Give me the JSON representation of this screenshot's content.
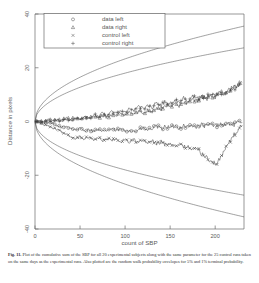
{
  "figure": {
    "number": "Fig. 11.",
    "caption": "Plot of the cumulative sum of the SBP for all 20 experimental subjects along with the same parameter for the 25 control runs taken on the same days as the experimental runs. Also plotted are the random walk probability envelopes for 5% and 1% terminal probability."
  },
  "chart_data": {
    "type": "line",
    "title": "",
    "xlabel": "count of SBP",
    "ylabel": "Distance in pixels",
    "xlim": [
      0,
      232
    ],
    "ylim": [
      -40,
      40
    ],
    "xticks": [
      0,
      50,
      100,
      150,
      200
    ],
    "yticks": [
      40,
      20,
      0,
      -20,
      -40
    ],
    "grid": false,
    "legend_position": "top-left",
    "legend": [
      {
        "marker": "circle",
        "label": "data left"
      },
      {
        "marker": "triangle",
        "label": "data right"
      },
      {
        "marker": "cross-x",
        "label": "control left"
      },
      {
        "marker": "plus",
        "label": "control right"
      }
    ],
    "envelopes": [
      {
        "name": "1% terminal probability upper",
        "k": 2.33,
        "sign": 1
      },
      {
        "name": "5% terminal probability upper",
        "k": 1.8,
        "sign": 1
      },
      {
        "name": "5% terminal probability lower",
        "k": 1.8,
        "sign": -1
      },
      {
        "name": "1% terminal probability lower",
        "k": 2.33,
        "sign": -1
      }
    ],
    "series": [
      {
        "name": "data left",
        "marker": "circle",
        "x": [
          0,
          5,
          10,
          15,
          20,
          25,
          30,
          35,
          40,
          45,
          50,
          55,
          60,
          65,
          70,
          75,
          80,
          85,
          90,
          95,
          100,
          105,
          110,
          115,
          120,
          125,
          130,
          135,
          140,
          145,
          150,
          155,
          160,
          165,
          170,
          175,
          180,
          185,
          190,
          195,
          200,
          205,
          210,
          215,
          220,
          225,
          230
        ],
        "y": [
          0,
          -0.3,
          -0.6,
          -0.4,
          -1.0,
          -1.6,
          -2.2,
          -1.8,
          -2.5,
          -3.1,
          -2.6,
          -3.4,
          -2.9,
          -3.6,
          -3.0,
          -3.8,
          -3.2,
          -2.7,
          -3.4,
          -2.9,
          -3.6,
          -3.0,
          -3.7,
          -3.1,
          -2.5,
          -3.2,
          -2.6,
          -1.9,
          -2.6,
          -1.8,
          -2.4,
          -1.7,
          -2.3,
          -1.5,
          -2.1,
          -1.4,
          -2.0,
          -1.2,
          -1.8,
          -1.0,
          -1.6,
          -0.8,
          -1.4,
          -0.6,
          -1.2,
          -0.5,
          -0.2
        ]
      },
      {
        "name": "data right",
        "marker": "triangle",
        "x": [
          0,
          5,
          10,
          15,
          20,
          25,
          30,
          35,
          40,
          45,
          50,
          55,
          60,
          65,
          70,
          75,
          80,
          85,
          90,
          95,
          100,
          105,
          110,
          115,
          120,
          125,
          130,
          135,
          140,
          145,
          150,
          155,
          160,
          165,
          170,
          175,
          180,
          185,
          190,
          195,
          200,
          205,
          210,
          215,
          220,
          225,
          230
        ],
        "y": [
          0,
          0.4,
          0.1,
          0.8,
          0.3,
          1.0,
          0.4,
          1.2,
          0.6,
          1.4,
          0.8,
          1.7,
          1.0,
          2.0,
          1.3,
          2.3,
          1.6,
          2.6,
          2.0,
          3.0,
          2.3,
          3.4,
          2.7,
          3.8,
          3.2,
          4.3,
          3.7,
          5.0,
          4.4,
          6.0,
          5.2,
          6.8,
          6.0,
          7.6,
          6.8,
          8.4,
          7.5,
          9.2,
          8.2,
          10.0,
          9.0,
          10.8,
          9.8,
          11.8,
          12.6,
          13.4,
          14.6
        ]
      },
      {
        "name": "control left",
        "marker": "cross-x",
        "x": [
          0,
          5,
          10,
          15,
          20,
          25,
          30,
          35,
          40,
          45,
          50,
          55,
          60,
          65,
          70,
          75,
          80,
          85,
          90,
          95,
          100,
          105,
          110,
          115,
          120,
          125,
          130,
          135,
          140,
          145,
          150,
          155,
          160,
          165,
          170,
          175,
          180,
          185,
          190,
          195,
          200,
          205,
          210,
          215,
          220,
          225,
          230
        ],
        "y": [
          0,
          -0.5,
          -1.1,
          -1.7,
          -2.4,
          -3.2,
          -4.0,
          -4.8,
          -5.6,
          -6.3,
          -5.7,
          -6.5,
          -5.9,
          -6.7,
          -6.1,
          -7.0,
          -6.3,
          -7.2,
          -6.5,
          -7.4,
          -6.7,
          -7.6,
          -6.9,
          -7.8,
          -7.1,
          -8.0,
          -7.3,
          -8.2,
          -7.6,
          -8.6,
          -7.9,
          -9.0,
          -8.3,
          -9.6,
          -9.0,
          -10.6,
          -10.0,
          -12.0,
          -13.2,
          -14.6,
          -16.0,
          -14.0,
          -11.0,
          -8.0,
          -5.5,
          -3.2,
          -1.4
        ]
      },
      {
        "name": "control right",
        "marker": "plus",
        "x": [
          0,
          5,
          10,
          15,
          20,
          25,
          30,
          35,
          40,
          45,
          50,
          55,
          60,
          65,
          70,
          75,
          80,
          85,
          90,
          95,
          100,
          105,
          110,
          115,
          120,
          125,
          130,
          135,
          140,
          145,
          150,
          155,
          160,
          165,
          170,
          175,
          180,
          185,
          190,
          195,
          200,
          205,
          210,
          215,
          220,
          225,
          230
        ],
        "y": [
          0,
          0.2,
          -0.2,
          0.5,
          -0.3,
          0.7,
          -0.1,
          1.0,
          0.2,
          1.4,
          0.6,
          2.0,
          1.1,
          2.6,
          1.7,
          3.2,
          2.2,
          3.9,
          2.8,
          4.6,
          3.4,
          5.2,
          4.0,
          5.8,
          4.6,
          6.4,
          5.2,
          7.0,
          5.8,
          7.6,
          6.4,
          8.2,
          7.0,
          8.8,
          7.6,
          9.3,
          8.2,
          9.8,
          8.8,
          10.3,
          9.4,
          10.9,
          10.0,
          11.5,
          12.2,
          13.0,
          13.8
        ]
      }
    ]
  }
}
